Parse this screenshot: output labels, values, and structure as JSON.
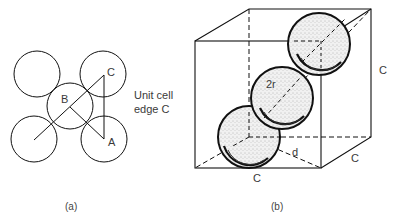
{
  "figure_a": {
    "caption": "(a)",
    "points": {
      "A": "A",
      "B": "B",
      "C": "C"
    },
    "side_label_line1": "Unit cell",
    "side_label_line2": "edge C"
  },
  "figure_b": {
    "caption": "(b)",
    "edge_labels": {
      "right": "C",
      "bottom": "C",
      "depth": "C"
    },
    "diameter_label": "2r",
    "diagonal_label": "d"
  },
  "colors": {
    "stroke": "#111111",
    "text": "#3a3a3a",
    "sphere_fill": "#e4e4e4"
  }
}
